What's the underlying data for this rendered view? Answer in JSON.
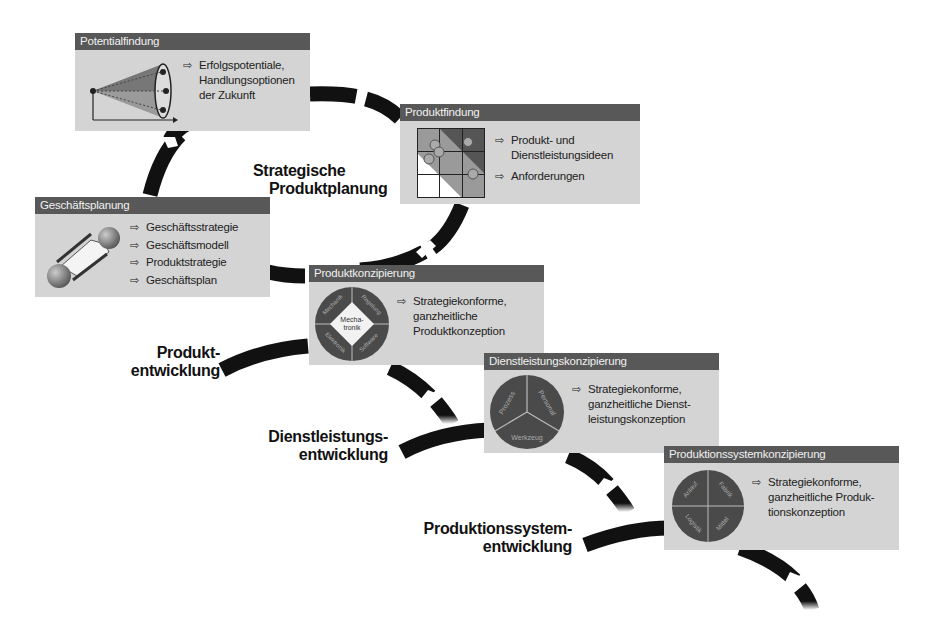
{
  "phases": [
    {
      "label_line1": "Strategische",
      "label_line2": "Produktplanung"
    },
    {
      "label_line1": "Produkt-",
      "label_line2": "entwicklung"
    },
    {
      "label_line1": "Dienstleistungs-",
      "label_line2": "entwicklung"
    },
    {
      "label_line1": "Produktionssystem-",
      "label_line2": "entwicklung"
    }
  ],
  "boxes": {
    "potentialfindung": {
      "title": "Potentialfindung",
      "icon": "cone-funnel-icon",
      "items": [
        "Erfolgspotentiale,",
        "Handlungsoptionen",
        "der Zukunft"
      ]
    },
    "produktfindung": {
      "title": "Produktfindung",
      "icon": "portfolio-matrix-icon",
      "items": [
        "Produkt- und",
        "Dienstleistungsideen",
        "Anforderungen"
      ]
    },
    "geschaeftsplanung": {
      "title": "Geschäftsplanung",
      "icon": "connected-spheres-icon",
      "items": [
        "Geschäftsstrategie",
        "Geschäftsmodell",
        "Produktstrategie",
        "Geschäftsplan"
      ]
    },
    "produktkonzipierung": {
      "title": "Produktkonzipierung",
      "icon": "mechatronik-circle-icon",
      "circle": {
        "center": "Mecha-tronik",
        "segments": [
          "Mechanik",
          "Regelungstechnik",
          "Elektronik",
          "Softwaretechnik"
        ]
      },
      "items": [
        "Strategiekonforme,",
        "ganzheitliche",
        "Produktkonzeption"
      ]
    },
    "dienstleistungskonzipierung": {
      "title": "Dienstleistungskonzipierung",
      "icon": "three-segment-circle-icon",
      "circle": {
        "segments": [
          "Prozess",
          "Personal",
          "Werkzeug"
        ]
      },
      "items": [
        "Strategiekonforme,",
        "ganzheitliche Dienst-",
        "leistungskonzeption"
      ]
    },
    "produktionssystemkonzipierung": {
      "title": "Produktionssystemkonzipierung",
      "icon": "four-segment-circle-icon",
      "circle": {
        "segments": [
          "Anlauf",
          "Fabrik",
          "Logistik",
          "Mittel"
        ]
      },
      "items": [
        "Strategiekonforme,",
        "ganzheitliche Produk-",
        "tionskonzeption"
      ]
    }
  },
  "arrow_glyph": "⇨",
  "colors": {
    "header": "#585858",
    "box": "#d4d4d4",
    "curve": "#111111",
    "circle": "#4a4a4a"
  }
}
